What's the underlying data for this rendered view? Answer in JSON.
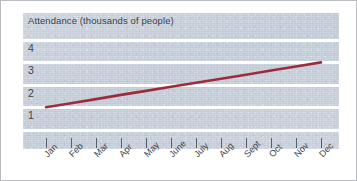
{
  "chart_data": {
    "type": "line",
    "title": "Attendance (thousands of people)",
    "xlabel": "",
    "ylabel": "",
    "categories": [
      "Jan",
      "Feb",
      "Mar",
      "Apr",
      "May",
      "June",
      "July",
      "Aug",
      "Sept",
      "Oct",
      "Nov",
      "Dec"
    ],
    "series": [
      {
        "name": "Attendance",
        "color": "#9e2b3c",
        "values": [
          1.0,
          1.18,
          1.36,
          1.55,
          1.73,
          1.91,
          2.09,
          2.27,
          2.45,
          2.64,
          2.82,
          3.0
        ]
      }
    ],
    "ytick_labels": [
      "4",
      "3",
      "2",
      "1"
    ],
    "ytick_values": [
      4,
      3,
      2,
      1
    ],
    "ylim": [
      0,
      4.5
    ],
    "grid": true,
    "gridline_color": "#ffffff",
    "legend": "none",
    "panel_color": "#c3ccd8"
  },
  "axes": {
    "y_labels": [
      {
        "text": "4"
      },
      {
        "text": "3"
      },
      {
        "text": "2"
      },
      {
        "text": "1"
      }
    ],
    "x_labels": [
      {
        "text": "Jan"
      },
      {
        "text": "Feb"
      },
      {
        "text": "Mar"
      },
      {
        "text": "Apr"
      },
      {
        "text": "May"
      },
      {
        "text": "June"
      },
      {
        "text": "July"
      },
      {
        "text": "Aug"
      },
      {
        "text": "Sept"
      },
      {
        "text": "Oct"
      },
      {
        "text": "Nov"
      },
      {
        "text": "Dec"
      }
    ]
  }
}
